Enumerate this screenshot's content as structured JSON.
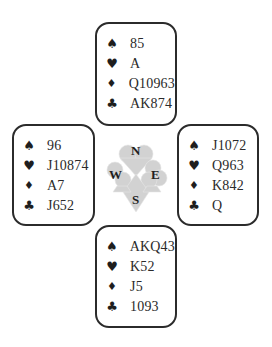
{
  "diagram": {
    "type": "bridge-deal",
    "suit_symbols": {
      "spades": "♠",
      "hearts": "♥",
      "diamonds": "♦",
      "clubs": "♣"
    },
    "hands": {
      "north": {
        "spades": "85",
        "hearts": "A",
        "diamonds": "Q10963",
        "clubs": "AK874"
      },
      "west": {
        "spades": "96",
        "hearts": "J10874",
        "diamonds": "A7",
        "clubs": "J652"
      },
      "east": {
        "spades": "J1072",
        "hearts": "Q963",
        "diamonds": "K842",
        "clubs": "Q"
      },
      "south": {
        "spades": "AKQ43",
        "hearts": "K52",
        "diamonds": "J5",
        "clubs": "1093"
      }
    },
    "compass": {
      "north": "N",
      "west": "W",
      "east": "E",
      "south": "S"
    },
    "colors": {
      "border": "#2b2b2b",
      "text": "#2a2a2a",
      "compass_fill": "#c9c9c9"
    }
  }
}
